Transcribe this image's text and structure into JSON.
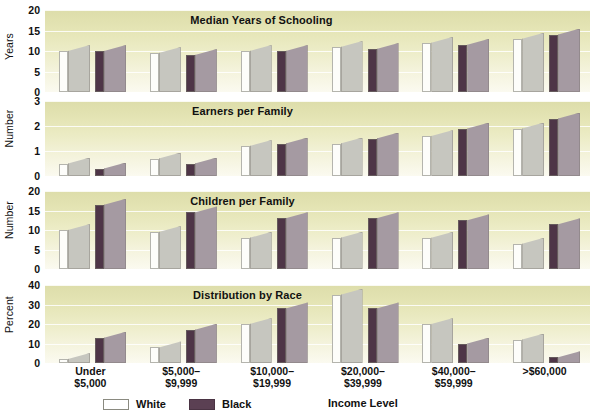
{
  "figure": {
    "x_axis_title": "Income Level",
    "categories": [
      {
        "line1": "Under",
        "line2": "$5,000"
      },
      {
        "line1": "$5,000–",
        "line2": "$9,999"
      },
      {
        "line1": "$10,000–",
        "line2": "$19,999"
      },
      {
        "line1": "$20,000–",
        "line2": "$39,999"
      },
      {
        "line1": "$40,000–",
        "line2": "$59,999"
      },
      {
        "line1": ">$60,000",
        "line2": ""
      }
    ],
    "legend": [
      {
        "label": "White",
        "key": "white",
        "color": "#ffffff"
      },
      {
        "label": "Black",
        "key": "black",
        "color": "#5b4053"
      }
    ],
    "colors": {
      "white_front": "#fdfdfa",
      "white_side": "#c6c6bf",
      "black_front": "#4e3547",
      "black_side": "#a59aa2",
      "panel_bg_top": "#ddddaa",
      "panel_bg_bottom": "#fbfaf0",
      "gridline": "#ffffff"
    }
  },
  "panels": [
    {
      "title": "Median Years of Schooling",
      "ylabel": "Years",
      "ticks": [
        "20",
        "15",
        "10",
        "5",
        "0"
      ],
      "tick_values": [
        20,
        15,
        10,
        5,
        0
      ],
      "ymin": 0,
      "ymax": 20
    },
    {
      "title": "Earners per Family",
      "ylabel": "Number",
      "ticks": [
        "3",
        "2",
        "1",
        "0"
      ],
      "tick_values": [
        3,
        2,
        1,
        0
      ],
      "ymin": 0,
      "ymax": 3
    },
    {
      "title": "Children per Family",
      "ylabel": "Number",
      "ticks": [
        "20",
        "15",
        "10",
        "5",
        "0"
      ],
      "tick_values": [
        20,
        15,
        10,
        5,
        0
      ],
      "ymin": 0,
      "ymax": 20
    },
    {
      "title": "Distribution by Race",
      "ylabel": "Percent",
      "ticks": [
        "40",
        "30",
        "20",
        "10",
        "0"
      ],
      "tick_values": [
        40,
        30,
        20,
        10,
        0
      ],
      "ymin": 0,
      "ymax": 40
    }
  ],
  "chart_data": [
    {
      "type": "bar",
      "title": "Median Years of Schooling",
      "xlabel": "Income Level",
      "ylabel": "Years",
      "ylim": [
        0,
        20
      ],
      "yticks": [
        0,
        5,
        10,
        15,
        20
      ],
      "grid": true,
      "legend_position": "bottom",
      "categories": [
        "Under $5,000",
        "$5,000–$9,999",
        "$10,000–$19,999",
        "$20,000–$39,999",
        "$40,000–$59,999",
        ">$60,000"
      ],
      "series": [
        {
          "name": "White",
          "values": [
            10,
            9.5,
            10,
            11,
            12,
            13
          ]
        },
        {
          "name": "Black",
          "values": [
            10,
            9,
            10,
            10.5,
            11.5,
            14
          ]
        }
      ]
    },
    {
      "type": "bar",
      "title": "Earners per Family",
      "xlabel": "Income Level",
      "ylabel": "Number",
      "ylim": [
        0,
        3
      ],
      "yticks": [
        0,
        1,
        2,
        3
      ],
      "grid": true,
      "legend_position": "bottom",
      "categories": [
        "Under $5,000",
        "$5,000–$9,999",
        "$10,000–$19,999",
        "$20,000–$39,999",
        "$40,000–$59,999",
        ">$60,000"
      ],
      "series": [
        {
          "name": "White",
          "values": [
            0.5,
            0.7,
            1.2,
            1.3,
            1.6,
            1.9
          ]
        },
        {
          "name": "Black",
          "values": [
            0.3,
            0.5,
            1.3,
            1.5,
            1.9,
            2.3
          ]
        }
      ]
    },
    {
      "type": "bar",
      "title": "Children per Family",
      "xlabel": "Income Level",
      "ylabel": "Number",
      "ylim": [
        0,
        20
      ],
      "yticks": [
        0,
        5,
        10,
        15,
        20
      ],
      "grid": true,
      "legend_position": "bottom",
      "categories": [
        "Under $5,000",
        "$5,000–$9,999",
        "$10,000–$19,999",
        "$20,000–$39,999",
        "$40,000–$59,999",
        ">$60,000"
      ],
      "series": [
        {
          "name": "White",
          "values": [
            10,
            9.5,
            8,
            8,
            8,
            6.5
          ]
        },
        {
          "name": "Black",
          "values": [
            16.5,
            14.5,
            13,
            13,
            12.5,
            11.5
          ]
        }
      ]
    },
    {
      "type": "bar",
      "title": "Distribution by Race",
      "xlabel": "Income Level",
      "ylabel": "Percent",
      "ylim": [
        0,
        40
      ],
      "yticks": [
        0,
        10,
        20,
        30,
        40
      ],
      "grid": true,
      "legend_position": "bottom",
      "categories": [
        "Under $5,000",
        "$5,000–$9,999",
        "$10,000–$19,999",
        "$20,000–$39,999",
        "$40,000–$59,999",
        ">$60,000"
      ],
      "series": [
        {
          "name": "White",
          "values": [
            2,
            8,
            20,
            35,
            20,
            12
          ]
        },
        {
          "name": "Black",
          "values": [
            13,
            17,
            28,
            28,
            10,
            3
          ]
        }
      ]
    }
  ]
}
